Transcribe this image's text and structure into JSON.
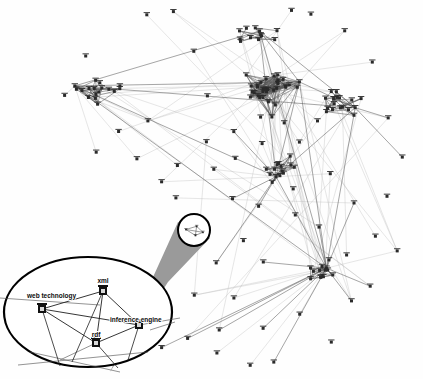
{
  "figure": {
    "background_color": "#fefefe",
    "edge_color": "#5a5a5a",
    "edge_color_faint": "#b8b8b8",
    "node_color": "#2a2a2a",
    "lens_cone_color": "#9a9a9a",
    "lens_outline_color": "#000000",
    "label_color": "#0d0d0d"
  },
  "detail_lens": {
    "shape": "ellipse",
    "center_x": 88,
    "center_y": 312,
    "radius_x": 84,
    "radius_y": 55,
    "nodes": [
      {
        "id": "web-technology",
        "label": "web technology",
        "x": 42,
        "y": 309,
        "label_x": 27,
        "label_y": 298,
        "anchor": "start"
      },
      {
        "id": "xml",
        "label": "xml",
        "x": 103,
        "y": 291,
        "label_x": 103,
        "label_y": 283,
        "anchor": "middle"
      },
      {
        "id": "inference-engine",
        "label": "inference engine",
        "x": 139,
        "y": 325,
        "label_x": 110,
        "label_y": 322,
        "anchor": "start"
      },
      {
        "id": "rdf",
        "label": "rdf",
        "x": 96,
        "y": 343,
        "label_x": 96,
        "label_y": 337,
        "anchor": "middle"
      }
    ],
    "edges": [
      [
        "web-technology",
        "xml"
      ],
      [
        "web-technology",
        "inference-engine"
      ],
      [
        "web-technology",
        "rdf"
      ],
      [
        "xml",
        "inference-engine"
      ],
      [
        "xml",
        "rdf"
      ],
      [
        "inference-engine",
        "rdf"
      ]
    ]
  },
  "selection_marker": {
    "shape": "circle",
    "center_x": 194,
    "center_y": 230,
    "radius": 16,
    "stroke_width": 2
  },
  "magnifier_cone": {
    "apex_left_x": 178,
    "apex_left_y": 222,
    "apex_right_x": 210,
    "apex_right_y": 238,
    "base_left_x": 110,
    "base_left_y": 372,
    "base_right_x": 168,
    "base_right_y": 282,
    "fill": "#9a9a9a"
  },
  "graph_data": {
    "type": "node-link-diagram",
    "node_count": 148,
    "edge_count": 312,
    "layout": "force-directed",
    "clusters": [
      {
        "name": "central-hub",
        "center_x": 272,
        "center_y": 92,
        "size": 34
      },
      {
        "name": "upper-peak",
        "center_x": 258,
        "center_y": 30,
        "size": 12
      },
      {
        "name": "left-cluster",
        "center_x": 100,
        "center_y": 90,
        "size": 16
      },
      {
        "name": "right-cluster",
        "center_x": 340,
        "center_y": 102,
        "size": 18
      },
      {
        "name": "lower-hub",
        "center_x": 276,
        "center_y": 170,
        "size": 14
      },
      {
        "name": "bottom-cluster",
        "center_x": 325,
        "center_y": 272,
        "size": 13
      },
      {
        "name": "selected-quad",
        "center_x": 194,
        "center_y": 230,
        "size": 4
      }
    ]
  }
}
